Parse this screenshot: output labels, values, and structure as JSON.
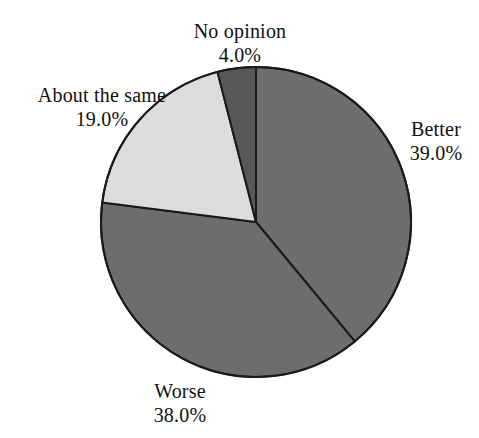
{
  "chart_data": {
    "type": "pie",
    "title": "",
    "subtitle": "",
    "xlabel": "",
    "ylabel": "",
    "legend_position": "none",
    "grid": false,
    "labels_outside": true,
    "start_angle_deg": 0,
    "direction": "clockwise",
    "categories": [
      "Better",
      "Worse",
      "About the same",
      "No opinion"
    ],
    "values": [
      39.0,
      38.0,
      19.0,
      4.0
    ],
    "value_suffix": "%",
    "total": 100.0,
    "slices": [
      {
        "name": "Better",
        "value": 39.0,
        "value_text": "39.0%",
        "color": "#6e6e6e",
        "start_deg": 0,
        "end_deg": 140.4
      },
      {
        "name": "Worse",
        "value": 38.0,
        "value_text": "38.0%",
        "color": "#6d6d6d",
        "start_deg": 140.4,
        "end_deg": 277.2
      },
      {
        "name": "About the same",
        "value": 19.0,
        "value_text": "19.0%",
        "color": "#dcdcdc",
        "start_deg": 277.2,
        "end_deg": 345.6
      },
      {
        "name": "No opinion",
        "value": 4.0,
        "value_text": "4.0%",
        "color": "#585858",
        "start_deg": 345.6,
        "end_deg": 360.0
      }
    ],
    "geometry": {
      "center_x": 256,
      "center_y": 222,
      "radius": 155
    },
    "style": {
      "background": "#ffffff",
      "outline_color": "#1a1a1a",
      "outline_width": 2,
      "text_color": "#111111"
    }
  },
  "labels": {
    "no_opinion": {
      "name": "No opinion",
      "value": "4.0%"
    },
    "about_the_same": {
      "name": "About the same",
      "value": "19.0%"
    },
    "better": {
      "name": "Better",
      "value": "39.0%"
    },
    "worse": {
      "name": "Worse",
      "value": "38.0%"
    }
  }
}
